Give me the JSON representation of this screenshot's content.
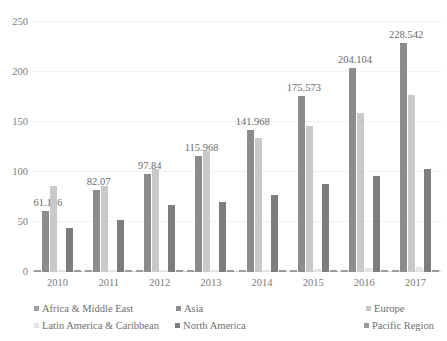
{
  "chart_data": {
    "type": "bar",
    "title": "",
    "xlabel": "",
    "ylabel": "",
    "categories": [
      "2010",
      "2011",
      "2012",
      "2013",
      "2014",
      "2015",
      "2016",
      "2017"
    ],
    "ylim": [
      0,
      250
    ],
    "yticks": [
      "0",
      "50",
      "100",
      "150",
      "200",
      "250"
    ],
    "ytick_values": [
      0,
      50,
      100,
      150,
      200,
      250
    ],
    "grid": true,
    "legend_position": "bottom",
    "data_labels": [
      "61.106",
      "82.07",
      "97.84",
      "115.968",
      "141.968",
      "175.573",
      "204.104",
      "228.542"
    ],
    "data_label_series": "Asia",
    "series": [
      {
        "name": "Africa & Middle East",
        "color": "#9e9e9e",
        "values": [
          1.2,
          1.2,
          1.4,
          1.6,
          1.8,
          2.0,
          2.2,
          2.4
        ]
      },
      {
        "name": "Asia",
        "color": "#8c8c8c",
        "values": [
          61.106,
          82.07,
          97.84,
          115.968,
          141.968,
          175.573,
          204.104,
          228.542
        ]
      },
      {
        "name": "Europe",
        "color": "#c9c9c9",
        "values": [
          86.0,
          86.5,
          103.0,
          121.0,
          134.0,
          146.5,
          159.0,
          177.5
        ]
      },
      {
        "name": "Latin America & Caribbean",
        "color": "#e4e4e4",
        "values": [
          1.0,
          1.0,
          1.2,
          1.4,
          2.0,
          3.5,
          4.5,
          5.0
        ]
      },
      {
        "name": "North America",
        "color": "#7d7d7d",
        "values": [
          44.0,
          52.0,
          67.0,
          70.0,
          77.0,
          88.0,
          96.5,
          103.5
        ]
      },
      {
        "name": "Pacific Region",
        "color": "#9a9a9a",
        "values": [
          0.9,
          0.9,
          1.0,
          1.1,
          1.3,
          1.5,
          1.7,
          1.9
        ]
      }
    ]
  },
  "legend": {
    "items": [
      {
        "label": "Africa & Middle East",
        "color": "#9e9e9e"
      },
      {
        "label": "Asia",
        "color": "#8c8c8c"
      },
      {
        "label": "Europe",
        "color": "#c9c9c9"
      },
      {
        "label": "Latin America & Caribbean",
        "color": "#e4e4e4"
      },
      {
        "label": "North America",
        "color": "#7d7d7d"
      },
      {
        "label": "Pacific Region",
        "color": "#9a9a9a"
      }
    ]
  },
  "colors": {
    "gridline": "#f2f2f2",
    "axis": "#d9d9d9",
    "text": "#7b7b7b",
    "background": "#ffffff"
  }
}
